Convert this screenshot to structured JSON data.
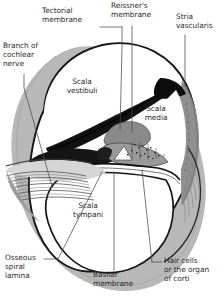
{
  "figure": {
    "type": "anatomical-diagram",
    "width": 218,
    "height": 304,
    "background_color": "#ffffff"
  },
  "colors": {
    "outline": "#1a1a1a",
    "bone_gray": "#b8b8b8",
    "bone_gray_light": "#cfcfcf",
    "bone_gray_dark": "#9a9a9a",
    "membrane_black": "#000000",
    "stria_gray": "#8c8c8c",
    "organ_gray": "#8f8f8f",
    "lumen_white": "#ffffff",
    "text": "#2b2b2b",
    "leader_line": "#4a4a4a"
  },
  "labels": [
    {
      "id": "tectorial-membrane",
      "text": "Tectorial\nmembrane",
      "x": 44,
      "y": 8,
      "align": "left"
    },
    {
      "id": "reissners-membrane",
      "text": "Reissner's\nmembrane",
      "x": 112,
      "y": 3,
      "align": "left"
    },
    {
      "id": "stria-vascularis",
      "text": "Stria\nvascularis",
      "x": 177,
      "y": 14,
      "align": "left"
    },
    {
      "id": "branch-of-cochlear-nerve",
      "text": "Branch of\ncochlear\nnerve",
      "x": 3,
      "y": 43,
      "align": "left"
    },
    {
      "id": "scala-vestibuli",
      "text": "Scala\nvestibuli",
      "x": 69,
      "y": 79,
      "align": "center"
    },
    {
      "id": "scala-media",
      "text": "Scala\nmedia",
      "x": 144,
      "y": 107,
      "align": "center"
    },
    {
      "id": "scala-tympani",
      "text": "Scala\ntympani",
      "x": 74,
      "y": 203,
      "align": "center"
    },
    {
      "id": "osseous-spiral-lamina",
      "text": "Osseous\nspiral\nlamina",
      "x": 6,
      "y": 255,
      "align": "left"
    },
    {
      "id": "basilar-membrane",
      "text": "Basilar\nmembrane",
      "x": 94,
      "y": 272,
      "align": "left"
    },
    {
      "id": "hair-cells-organ-of-corti",
      "text": "Hair cells\nor the organ\nof corti",
      "x": 165,
      "y": 258,
      "align": "left"
    }
  ],
  "structures": [
    {
      "id": "outer-bone-capsule",
      "name": "otic capsule bone",
      "fill": "#b8b8b8"
    },
    {
      "id": "scala-vestibuli-lumen",
      "name": "scala vestibuli",
      "fill": "#ffffff"
    },
    {
      "id": "scala-tympani-lumen",
      "name": "scala tympani",
      "fill": "#ffffff"
    },
    {
      "id": "scala-media-lumen",
      "name": "scala media",
      "fill": "#ffffff"
    },
    {
      "id": "reissners-membrane-line",
      "name": "Reissner's membrane",
      "fill": "#000000"
    },
    {
      "id": "basilar-membrane-line",
      "name": "basilar membrane",
      "fill": "#000000"
    },
    {
      "id": "stria-vascularis-band",
      "name": "stria vascularis",
      "fill": "#8c8c8c"
    },
    {
      "id": "organ-of-corti-mass",
      "name": "organ of Corti",
      "fill": "#8f8f8f"
    },
    {
      "id": "osseous-spiral-lamina-shelf",
      "name": "osseous spiral lamina",
      "fill": "#d4d4d4"
    },
    {
      "id": "cochlear-nerve-fibers",
      "name": "branch of cochlear nerve",
      "fill": "#6a6a6a"
    }
  ]
}
